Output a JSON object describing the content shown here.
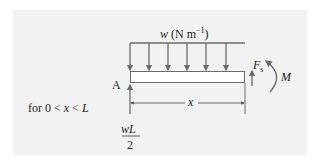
{
  "diagram": {
    "load_label": {
      "symbol": "w",
      "unit": "(N m",
      "exponent": "−1",
      "close": ")"
    },
    "support_label": "A",
    "shear_force": {
      "symbol": "F",
      "subscript": "s"
    },
    "moment_label": "M",
    "dimension_label": "x",
    "condition": {
      "prefix": "for 0 <",
      "var": "x",
      "mid": "<",
      "limit": "L"
    },
    "reaction": {
      "numerator": "wL",
      "denominator": "2"
    },
    "colors": {
      "panel_bg": "#f2f2f2",
      "line": "#6b6b6b",
      "text": "#222222",
      "beam_fill": "#ffffff"
    },
    "load_arrow_count": 6
  }
}
